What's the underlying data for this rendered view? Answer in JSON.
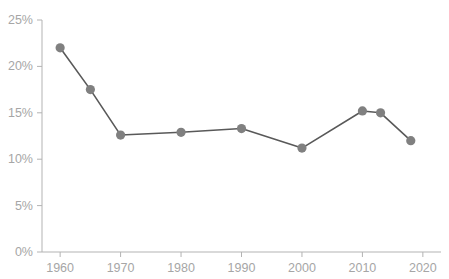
{
  "chart_data": {
    "type": "line",
    "title": " ",
    "subtitle": "",
    "xlabel": "",
    "ylabel": "",
    "x": [
      1960,
      1965,
      1970,
      1980,
      1990,
      2000,
      2010,
      2013,
      2018
    ],
    "values": [
      22.0,
      17.5,
      12.6,
      12.9,
      13.3,
      11.2,
      15.2,
      15.0,
      12.0
    ],
    "series": [
      {
        "name": "Rate",
        "x": [
          1960,
          1965,
          1970,
          1980,
          1990,
          2000,
          2010,
          2013,
          2018
        ],
        "values": [
          22.0,
          17.5,
          12.6,
          12.9,
          13.3,
          11.2,
          15.2,
          15.0,
          12.0
        ]
      }
    ],
    "xlim": [
      1957,
      2023
    ],
    "ylim": [
      0,
      25
    ],
    "xticks": [
      1960,
      1970,
      1980,
      1990,
      2000,
      2010,
      2020
    ],
    "xtick_labels": [
      "1960",
      "1970",
      "1980",
      "1990",
      "2000",
      "2010",
      "2020"
    ],
    "yticks": [
      0,
      5,
      10,
      15,
      20,
      25
    ],
    "ytick_labels": [
      "0%",
      "5%",
      "10%",
      "15%",
      "20%",
      "25%"
    ],
    "grid": false,
    "legend": false,
    "legend_position": "none",
    "marker": "circle",
    "colors": {
      "line": "#595959",
      "marker": "#808080",
      "axis": "#b3b3b3",
      "tick_label": "#a6a6a6",
      "title": "#c8c8c8",
      "background": "#ffffff"
    }
  }
}
